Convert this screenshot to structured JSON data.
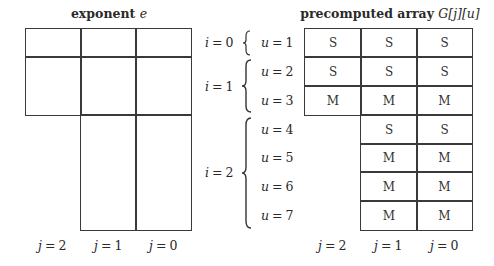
{
  "left_panel": {
    "title": "exponent",
    "title_var": "e",
    "column_labels": [
      {
        "var": "j",
        "value": "2"
      },
      {
        "var": "j",
        "value": "1"
      },
      {
        "var": "j",
        "value": "0"
      }
    ]
  },
  "middle_labels": {
    "groups": [
      {
        "var": "i",
        "value": "0",
        "rows": [
          {
            "var": "u",
            "value": "1"
          }
        ]
      },
      {
        "var": "i",
        "value": "1",
        "rows": [
          {
            "var": "u",
            "value": "2"
          },
          {
            "var": "u",
            "value": "3"
          }
        ]
      },
      {
        "var": "i",
        "value": "2",
        "rows": [
          {
            "var": "u",
            "value": "4"
          },
          {
            "var": "u",
            "value": "5"
          },
          {
            "var": "u",
            "value": "6"
          },
          {
            "var": "u",
            "value": "7"
          }
        ]
      }
    ]
  },
  "right_panel": {
    "title": "precomputed array",
    "title_var": "G[j][u]",
    "column_labels": [
      {
        "var": "j",
        "value": "2"
      },
      {
        "var": "j",
        "value": "1"
      },
      {
        "var": "j",
        "value": "0"
      }
    ],
    "rows": [
      {
        "u": 1,
        "cells": [
          "S",
          "S",
          "S"
        ]
      },
      {
        "u": 2,
        "cells": [
          "S",
          "S",
          "S"
        ]
      },
      {
        "u": 3,
        "cells": [
          "M",
          "M",
          "M"
        ]
      },
      {
        "u": 4,
        "cells": [
          null,
          "S",
          "S"
        ]
      },
      {
        "u": 5,
        "cells": [
          null,
          "M",
          "M"
        ]
      },
      {
        "u": 6,
        "cells": [
          null,
          "M",
          "M"
        ]
      },
      {
        "u": 7,
        "cells": [
          null,
          "M",
          "M"
        ]
      }
    ]
  }
}
